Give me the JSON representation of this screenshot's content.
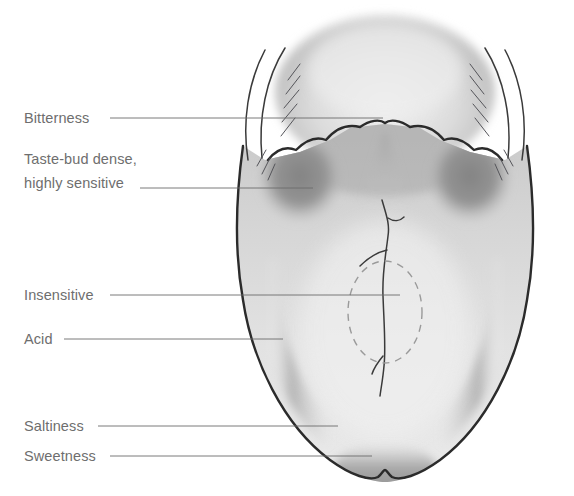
{
  "figure": {
    "background_color": "#ffffff",
    "label_color": "#6e6e6e",
    "leader_color": "#6b6b6b",
    "outline_color": "#2b2b2b"
  },
  "labels": [
    {
      "id": "bitterness",
      "text": "Bitterness",
      "text_x": 24,
      "text_y": 123,
      "leader": {
        "x1": 110,
        "y1": 118,
        "x2": 383,
        "y2": 118
      },
      "target": "posterior-bitter-zone"
    },
    {
      "id": "taste-bud-dense",
      "text_line_1": "Taste-bud dense,",
      "text_line_2": "highly sensitive",
      "text_x": 24,
      "text_y": 164,
      "text_y2": 188,
      "leader": {
        "x1": 140,
        "y1": 188,
        "x2": 313,
        "y2": 188
      },
      "target": "circumvallate-papillae-zone"
    },
    {
      "id": "insensitive",
      "text": "Insensitive",
      "text_x": 24,
      "text_y": 300,
      "leader": {
        "x1": 110,
        "y1": 295,
        "x2": 400,
        "y2": 295
      },
      "target": "central-insensitive-zone"
    },
    {
      "id": "acid",
      "text": "Acid",
      "text_x": 24,
      "text_y": 344,
      "leader": {
        "x1": 64,
        "y1": 339,
        "x2": 283,
        "y2": 339
      },
      "target": "lateral-sour-zone"
    },
    {
      "id": "saltiness",
      "text": "Saltiness",
      "text_x": 24,
      "text_y": 431,
      "leader": {
        "x1": 98,
        "y1": 426,
        "x2": 338,
        "y2": 426
      },
      "target": "lateral-anterior-salt-zone"
    },
    {
      "id": "sweetness",
      "text": "Sweetness",
      "text_x": 24,
      "text_y": 461,
      "leader": {
        "x1": 110,
        "y1": 456,
        "x2": 372,
        "y2": 456
      },
      "target": "tip-sweet-zone"
    }
  ],
  "regions": [
    {
      "id": "epiglottis",
      "name": "epiglottis dome",
      "shade": "#b8b8b8"
    },
    {
      "id": "tongue-body",
      "name": "tongue dorsum",
      "shade": "#d4d4d4"
    },
    {
      "id": "bitter-zone",
      "name": "posterior bitter band",
      "shade": "#a0a0a0"
    },
    {
      "id": "papillae-zone",
      "name": "circumvallate papillae patch",
      "shade": "#8d8d8d"
    },
    {
      "id": "sour-band",
      "name": "lateral acid band",
      "shade": "#b4b4b4"
    },
    {
      "id": "salt-band",
      "name": "lateral salt band",
      "shade": "#b4b4b4"
    },
    {
      "id": "sweet-tip",
      "name": "tip sweet zone",
      "shade": "#9e9e9e"
    },
    {
      "id": "insensitive-ellipse",
      "name": "central insensitive ellipse",
      "shade": "none"
    }
  ]
}
